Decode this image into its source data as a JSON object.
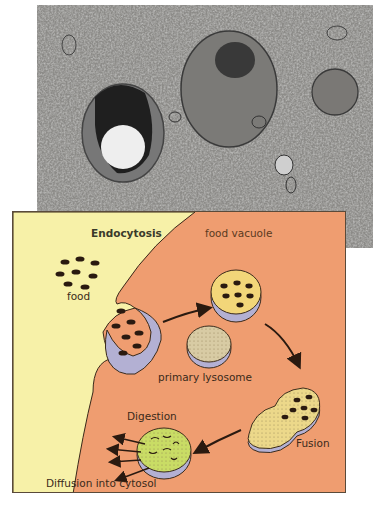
{
  "figure": {
    "micrograph": {
      "description": "Electron micrograph showing a secondary lysosome, a primary lysosome/vesicle and surrounding cytoplasm"
    },
    "diagram": {
      "title": "Endocytosis",
      "labels": {
        "endocytosis": "Endocytosis",
        "food": "food",
        "food_vacuole": "food vacuole",
        "primary_lysosome": "primary lysosome",
        "fusion": "Fusion",
        "digestion": "Digestion",
        "diffusion": "Diffusion into cytosol"
      },
      "colors": {
        "extracellular": "#f7f1a8",
        "cytoplasm": "#ef9d70",
        "membrane_purple": "#b3b0d3",
        "vacuole_yellow": "#f2d679",
        "lysosome_beige": "#d8cba4",
        "digestion_green": "#c9dc65",
        "food_particle": "#2a1a10",
        "outline": "#3a2a1a"
      }
    }
  }
}
